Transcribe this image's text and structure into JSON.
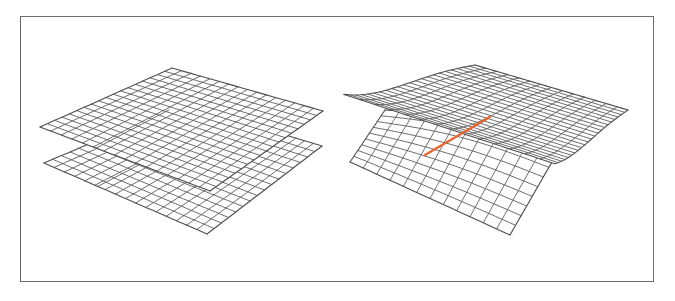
{
  "figure": {
    "frame": {
      "border_color": "#6a6a6a",
      "background": "#ffffff"
    },
    "grid_color": "#5c5c5c",
    "highlight_color": "#e8642c",
    "panels": [
      {
        "id": "left",
        "description": "Two parallel flat grid sheets stacked vertically, each with an orange highlighted line",
        "sheets": [
          {
            "name": "lower-sheet",
            "corners": {
              "top": [
                183,
                104
              ],
              "left": [
                44,
                163
              ],
              "right": [
                322,
                146
              ],
              "bottom": [
                207,
                234
              ]
            },
            "cells_u": 16,
            "cells_v": 16,
            "highlight": {
              "from_u": 0.33,
              "to_u": 0.33,
              "v_start": 0.62,
              "v_end": 1.0
            }
          },
          {
            "name": "upper-sheet",
            "corners": {
              "top": [
                172,
                68
              ],
              "left": [
                40,
                127
              ],
              "right": [
                323,
                111
              ],
              "bottom": [
                210,
                191
              ]
            },
            "cells_u": 16,
            "cells_v": 18,
            "highlight": {
              "from_u": 0.33,
              "to_u": 0.33,
              "v_start": 0.42,
              "v_end": 1.0
            }
          }
        ]
      },
      {
        "id": "right",
        "description": "Twisted/folded grid surface: upper sheet curls down over a lower sheet, orange highlighted line along fold",
        "sheets": [
          {
            "name": "lower-curved-sheet",
            "corners": {
              "top": [
                385,
                110
              ],
              "left": [
                350,
                162
              ],
              "right": [
                560,
                148
              ],
              "bottom": [
                510,
                235
              ]
            },
            "cells_u": 12,
            "cells_v": 9,
            "bend": 14
          },
          {
            "name": "upper-twisted-sheet",
            "corners": {
              "top": [
                475,
                65
              ],
              "left": [
                344,
                89
              ],
              "right": [
                628,
                110
              ],
              "bottom": [
                555,
                160
              ]
            },
            "cells_u": 14,
            "cells_v": 22,
            "sag": 22
          }
        ],
        "highlight": {
          "from": [
            425,
            155
          ],
          "to": [
            490,
            117
          ]
        }
      }
    ]
  }
}
